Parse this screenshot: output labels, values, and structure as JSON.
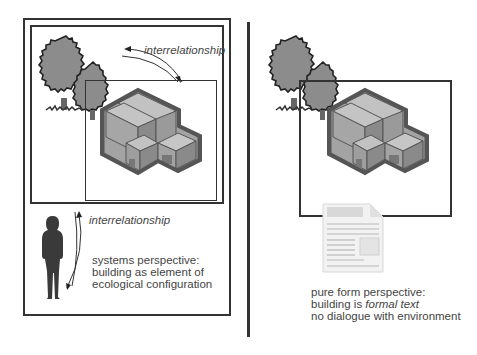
{
  "left_panel": {
    "top_arrow_label": "interrelationship",
    "side_arrow_label": "interrelationship",
    "caption": {
      "line1": "systems perspective:",
      "line2": "building as element of",
      "line3": "ecological configuration"
    }
  },
  "right_panel": {
    "caption": {
      "line1": "pure form perspective:",
      "line2_prefix": "building is ",
      "line2_italic": "formal text",
      "line3": "no dialogue with environment"
    }
  },
  "icons": {
    "trees": "tree-icon",
    "building": "isometric-building-icon",
    "person": "person-silhouette-icon",
    "document": "document-icon",
    "arrows": "double-arrow-icon"
  },
  "colors": {
    "line": "#333333",
    "tree_fill": "#8c8c8c",
    "building_outline": "#555555",
    "building_top": "#c2c2c2",
    "building_left": "#a3a3a3",
    "building_right": "#8a8a8a",
    "text": "#444444"
  }
}
